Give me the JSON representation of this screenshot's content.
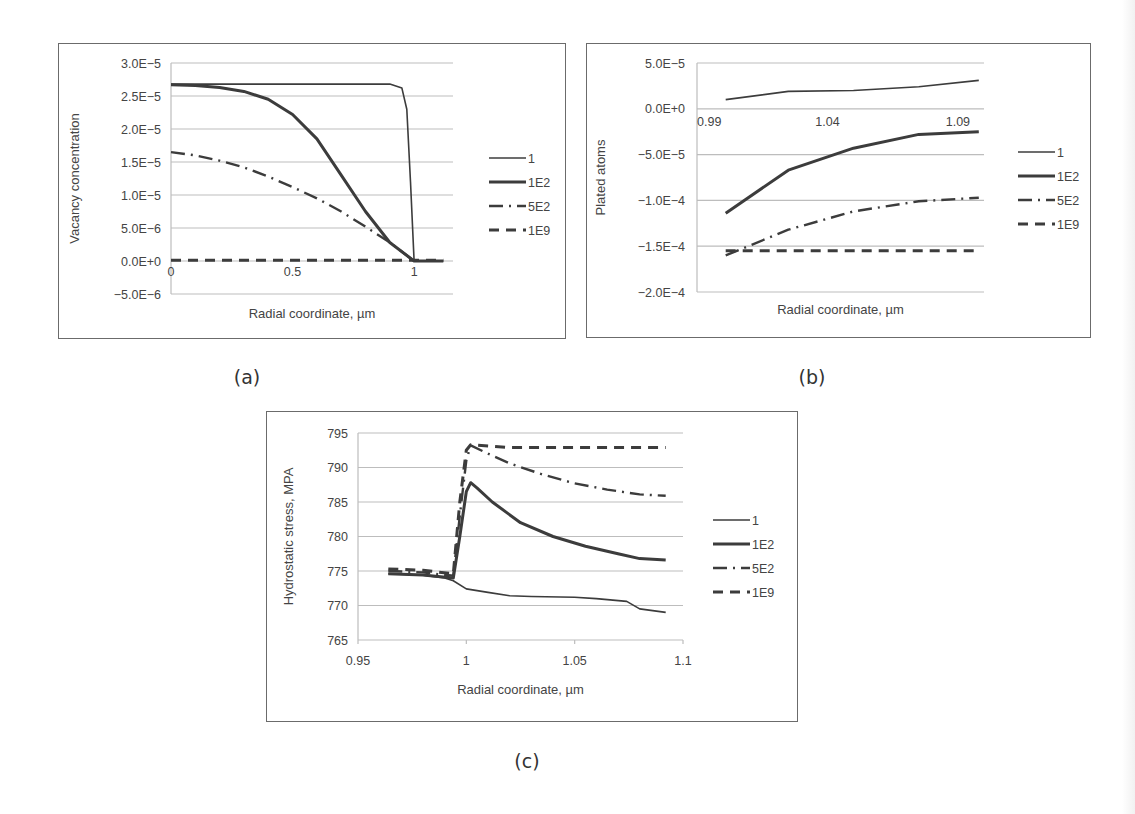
{
  "captions": {
    "a": "(a)",
    "b": "(b)",
    "c": "(c)"
  },
  "colors": {
    "line": "#3c3c3c",
    "grid": "#bdbdbd",
    "frame": "#6b6b6b",
    "text": "#444444"
  },
  "legend": [
    "1",
    "1E2",
    "5E2",
    "1E9"
  ],
  "chart_data": [
    {
      "id": "a",
      "type": "line",
      "title": "",
      "xlabel": "Radial coordinate, µm",
      "ylabel": "Vacancy concentration",
      "xlim": [
        0,
        1.16
      ],
      "ylim": [
        -5e-06,
        3e-05
      ],
      "x_ticks": [
        0,
        0.5,
        1
      ],
      "x_tick_labels": [
        "0",
        "0.5",
        "1"
      ],
      "y_ticks": [
        -5e-06,
        0,
        5e-06,
        1e-05,
        1.5e-05,
        2e-05,
        2.5e-05,
        3e-05
      ],
      "y_tick_labels": [
        "−5.0E−6",
        "0.0E+0",
        "5.0E−6",
        "1.0E−5",
        "1.5E−5",
        "2.0E−5",
        "2.5E−5",
        "3.0E−5"
      ],
      "grid": true,
      "legend_position": "right",
      "series": [
        {
          "name": "1",
          "style": "solid-thin",
          "x": [
            0,
            0.3,
            0.6,
            0.9,
            0.95,
            0.97,
            0.985,
            1.0,
            1.05,
            1.12
          ],
          "y": [
            2.68e-05,
            2.68e-05,
            2.68e-05,
            2.68e-05,
            2.62e-05,
            2.3e-05,
            1.2e-05,
            0,
            0,
            0
          ]
        },
        {
          "name": "1E2",
          "style": "solid-thick",
          "x": [
            0,
            0.1,
            0.2,
            0.3,
            0.4,
            0.5,
            0.6,
            0.7,
            0.8,
            0.9,
            1.0,
            1.12
          ],
          "y": [
            2.67e-05,
            2.66e-05,
            2.63e-05,
            2.57e-05,
            2.45e-05,
            2.22e-05,
            1.85e-05,
            1.3e-05,
            7.5e-06,
            2.8e-06,
            0,
            0
          ]
        },
        {
          "name": "5E2",
          "style": "dash-dot",
          "x": [
            0,
            0.1,
            0.2,
            0.3,
            0.4,
            0.5,
            0.6,
            0.7,
            0.8,
            0.9,
            1.0
          ],
          "y": [
            1.65e-05,
            1.6e-05,
            1.52e-05,
            1.42e-05,
            1.28e-05,
            1.12e-05,
            9.5e-06,
            7.5e-06,
            5.2e-06,
            2.8e-06,
            0
          ]
        },
        {
          "name": "1E9",
          "style": "dashed",
          "x": [
            0,
            0.5,
            1.0,
            1.12
          ],
          "y": [
            1e-07,
            1e-07,
            1e-07,
            1e-07
          ]
        }
      ]
    },
    {
      "id": "b",
      "type": "line",
      "title": "",
      "xlabel": "Radial coordinate, µm",
      "ylabel": "Plated atoms",
      "xlim": [
        0.99,
        1.1
      ],
      "ylim": [
        -0.0002,
        5e-05
      ],
      "x_ticks": [
        0.99,
        1.04,
        1.09
      ],
      "x_tick_labels": [
        "0.99",
        "1.04",
        "1.09"
      ],
      "x_axis_crosses_at": 0,
      "y_ticks": [
        -0.0002,
        -0.00015,
        -0.0001,
        -5e-05,
        0,
        5e-05
      ],
      "y_tick_labels": [
        "−2.0E−4",
        "−1.5E−4",
        "−1.0E−4",
        "−5.0E−5",
        "0.0E+0",
        "5.0E−5"
      ],
      "grid": true,
      "legend_position": "right",
      "series": [
        {
          "name": "1",
          "style": "solid-thin",
          "x": [
            1.001,
            1.025,
            1.05,
            1.075,
            1.098
          ],
          "y": [
            1e-05,
            1.9e-05,
            2e-05,
            2.4e-05,
            3.1e-05
          ]
        },
        {
          "name": "1E2",
          "style": "solid-thick",
          "x": [
            1.001,
            1.025,
            1.05,
            1.075,
            1.098
          ],
          "y": [
            -0.000114,
            -6.7e-05,
            -4.3e-05,
            -2.8e-05,
            -2.5e-05
          ]
        },
        {
          "name": "5E2",
          "style": "dash-dot",
          "x": [
            1.001,
            1.025,
            1.05,
            1.075,
            1.098
          ],
          "y": [
            -0.00016,
            -0.000132,
            -0.000112,
            -0.000101,
            -9.7e-05
          ]
        },
        {
          "name": "1E9",
          "style": "dashed",
          "x": [
            1.001,
            1.025,
            1.05,
            1.075,
            1.098
          ],
          "y": [
            -0.000155,
            -0.000155,
            -0.000155,
            -0.000155,
            -0.000155
          ]
        }
      ]
    },
    {
      "id": "c",
      "type": "line",
      "title": "",
      "xlabel": "Radial coordinate, µm",
      "ylabel": "Hydrostatic stress, MPA",
      "xlim": [
        0.95,
        1.1
      ],
      "ylim": [
        765,
        795
      ],
      "x_ticks": [
        0.95,
        1,
        1.05,
        1.1
      ],
      "x_tick_labels": [
        "0.95",
        "1",
        "1.05",
        "1.1"
      ],
      "y_ticks": [
        765,
        770,
        775,
        780,
        785,
        790,
        795
      ],
      "y_tick_labels": [
        "765",
        "770",
        "775",
        "780",
        "785",
        "790",
        "795"
      ],
      "grid": true,
      "legend_position": "right",
      "series": [
        {
          "name": "1",
          "style": "solid-thin",
          "x": [
            0.964,
            0.98,
            0.99,
            0.994,
            1.0,
            1.01,
            1.02,
            1.03,
            1.05,
            1.06,
            1.074,
            1.08,
            1.092
          ],
          "y": [
            774.6,
            774.4,
            774.0,
            773.6,
            772.4,
            771.9,
            771.4,
            771.3,
            771.2,
            771.0,
            770.6,
            769.5,
            769.0
          ]
        },
        {
          "name": "1E2",
          "style": "solid-thick",
          "x": [
            0.964,
            0.98,
            0.994,
            0.997,
            1.0,
            1.002,
            1.005,
            1.012,
            1.025,
            1.04,
            1.055,
            1.07,
            1.08,
            1.092
          ],
          "y": [
            774.6,
            774.4,
            774.0,
            780,
            786.5,
            787.8,
            787.0,
            785.0,
            782.0,
            780.0,
            778.6,
            777.5,
            776.8,
            776.6
          ]
        },
        {
          "name": "5E2",
          "style": "dash-dot",
          "x": [
            0.964,
            0.98,
            0.994,
            0.997,
            1.0,
            1.002,
            1.01,
            1.02,
            1.035,
            1.05,
            1.065,
            1.08,
            1.092
          ],
          "y": [
            775.0,
            774.8,
            774.3,
            783,
            791,
            793.2,
            792.0,
            790.6,
            789.0,
            787.7,
            786.8,
            786.1,
            785.9
          ]
        },
        {
          "name": "1E9",
          "style": "dashed",
          "x": [
            0.964,
            0.98,
            0.994,
            0.997,
            1.0,
            1.002,
            1.02,
            1.05,
            1.08,
            1.092
          ],
          "y": [
            775.3,
            775.1,
            774.6,
            785,
            792.5,
            793.3,
            792.9,
            792.9,
            792.9,
            792.9
          ]
        }
      ]
    }
  ]
}
